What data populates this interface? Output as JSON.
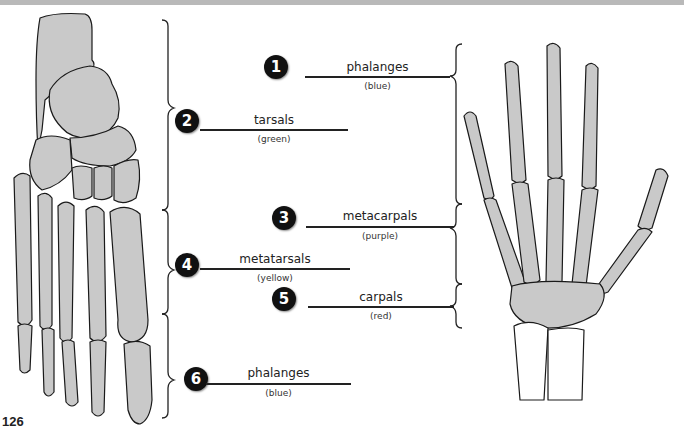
{
  "page_number": "126",
  "colors": {
    "bone_fill": "#c8c8c8",
    "bone_stroke": "#1a1a1a",
    "badge_bg": "#111111",
    "badge_text": "#ffffff",
    "top_band": "#b9b9b9"
  },
  "figures": {
    "foot": "foot-skeleton-illustration",
    "hand": "hand-skeleton-illustration"
  },
  "labels": [
    {
      "number": "1",
      "name": "phalanges",
      "color_hint": "(blue)",
      "target": "hand"
    },
    {
      "number": "2",
      "name": "tarsals",
      "color_hint": "(green)",
      "target": "foot"
    },
    {
      "number": "3",
      "name": "metacarpals",
      "color_hint": "(purple)",
      "target": "hand"
    },
    {
      "number": "4",
      "name": "metatarsals",
      "color_hint": "(yellow)",
      "target": "foot"
    },
    {
      "number": "5",
      "name": "carpals",
      "color_hint": "(red)",
      "target": "hand"
    },
    {
      "number": "6",
      "name": "phalanges",
      "color_hint": "(blue)",
      "target": "foot"
    }
  ]
}
